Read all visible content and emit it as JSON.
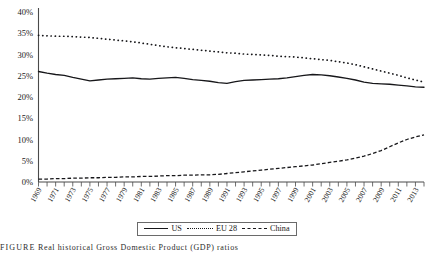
{
  "chart_data": {
    "type": "line",
    "title": "",
    "xlabel": "",
    "ylabel": "",
    "ylim": [
      0,
      40
    ],
    "xlim": [
      1969,
      2014
    ],
    "grid": false,
    "legend_position": "below-axis",
    "ytick_labels": [
      "40%",
      "35%",
      "30%",
      "25%",
      "20%",
      "15%",
      "10%",
      "5%",
      "0%"
    ],
    "ytick_values": [
      40,
      35,
      30,
      25,
      20,
      15,
      10,
      5,
      0
    ],
    "xtick_labels": [
      "1969",
      "1971",
      "1973",
      "1975",
      "1977",
      "1979",
      "1981",
      "1983",
      "1985",
      "1987",
      "1989",
      "1991",
      "1993",
      "1995",
      "1997",
      "1999",
      "2001",
      "2003",
      "2005",
      "2007",
      "2009",
      "2011",
      "2013"
    ],
    "x": [
      1969,
      1970,
      1971,
      1972,
      1973,
      1974,
      1975,
      1976,
      1977,
      1978,
      1979,
      1980,
      1981,
      1982,
      1983,
      1984,
      1985,
      1986,
      1987,
      1988,
      1989,
      1990,
      1991,
      1992,
      1993,
      1994,
      1995,
      1996,
      1997,
      1998,
      1999,
      2000,
      2001,
      2002,
      2003,
      2004,
      2005,
      2006,
      2007,
      2008,
      2009,
      2010,
      2011,
      2012,
      2013,
      2014
    ],
    "series": [
      {
        "name": "US",
        "style": "solid",
        "values": [
          26.0,
          25.6,
          25.3,
          25.1,
          24.6,
          24.2,
          23.8,
          24.0,
          24.2,
          24.3,
          24.4,
          24.5,
          24.3,
          24.2,
          24.4,
          24.5,
          24.6,
          24.4,
          24.1,
          23.9,
          23.7,
          23.4,
          23.2,
          23.6,
          23.9,
          24.0,
          24.1,
          24.2,
          24.3,
          24.5,
          24.8,
          25.1,
          25.3,
          25.2,
          25.0,
          24.7,
          24.4,
          24.0,
          23.5,
          23.2,
          23.1,
          23.0,
          22.8,
          22.6,
          22.4,
          22.3
        ]
      },
      {
        "name": "EU 28",
        "style": "dotted",
        "values": [
          34.5,
          34.4,
          34.3,
          34.3,
          34.2,
          34.1,
          34.0,
          33.8,
          33.6,
          33.4,
          33.2,
          33.0,
          32.7,
          32.4,
          32.1,
          31.8,
          31.6,
          31.4,
          31.2,
          31.0,
          30.8,
          30.6,
          30.4,
          30.3,
          30.1,
          30.0,
          29.9,
          29.8,
          29.6,
          29.5,
          29.4,
          29.2,
          29.0,
          28.8,
          28.6,
          28.3,
          28.0,
          27.6,
          27.1,
          26.6,
          26.1,
          25.6,
          25.1,
          24.5,
          24.0,
          23.5
        ]
      },
      {
        "name": "China",
        "style": "dashed",
        "values": [
          0.7,
          0.7,
          0.8,
          0.8,
          0.9,
          0.9,
          1.0,
          1.0,
          1.1,
          1.1,
          1.2,
          1.2,
          1.3,
          1.3,
          1.4,
          1.5,
          1.5,
          1.6,
          1.6,
          1.7,
          1.7,
          1.8,
          2.0,
          2.2,
          2.4,
          2.6,
          2.8,
          3.0,
          3.2,
          3.4,
          3.6,
          3.8,
          4.0,
          4.3,
          4.6,
          4.9,
          5.2,
          5.6,
          6.1,
          6.7,
          7.4,
          8.3,
          9.2,
          10.0,
          10.6,
          11.1
        ]
      }
    ]
  },
  "legend": {
    "items": [
      {
        "label": "US",
        "style": "solid"
      },
      {
        "label": "EU 28",
        "style": "dotted"
      },
      {
        "label": "China",
        "style": "dashed"
      }
    ]
  },
  "caption": {
    "label": "FIGURE",
    "text": "Real historical Gross Domestic Product (GDP) ratios"
  }
}
